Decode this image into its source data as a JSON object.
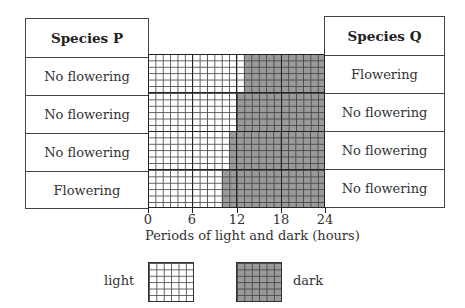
{
  "species_p": {
    "header": "Species P",
    "rows": [
      "No flowering",
      "No flowering",
      "No flowering",
      "Flowering"
    ]
  },
  "species_q": {
    "header": "Species Q",
    "rows": [
      "Flowering",
      "No flowering",
      "No flowering",
      "No flowering"
    ]
  },
  "photoperiods": [
    {
      "light_hours": 13,
      "dark_hours": 11
    },
    {
      "light_hours": 12,
      "dark_hours": 12
    },
    {
      "light_hours": 11,
      "dark_hours": 13
    },
    {
      "light_hours": 10,
      "dark_hours": 14
    }
  ],
  "axis": {
    "ticks": [
      "0",
      "6",
      "12",
      "18",
      "24"
    ],
    "label": "Periods of light and dark (hours)"
  },
  "legend": {
    "light": "light",
    "dark": "dark"
  },
  "colors": {
    "light": "#ffffff",
    "dark": "#9a9a9a"
  }
}
